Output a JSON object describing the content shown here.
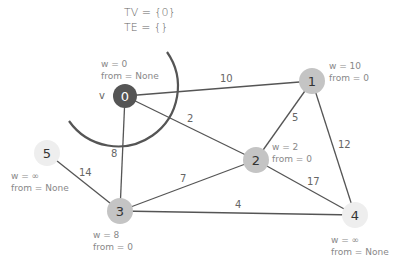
{
  "sets": {
    "tv": "TV = {0}",
    "te": "TE = {}"
  },
  "current_marker": "v",
  "nodes": [
    {
      "id": "0",
      "x": 125,
      "y": 96,
      "fill": "#555555",
      "text_color": "#ffffff",
      "w": "w = 0",
      "from": "from = None"
    },
    {
      "id": "1",
      "x": 312,
      "y": 81,
      "fill": "#c4c4c4",
      "text_color": "#333333",
      "w": "w = 10",
      "from": "from = 0"
    },
    {
      "id": "2",
      "x": 256,
      "y": 160,
      "fill": "#c4c4c4",
      "text_color": "#333333",
      "w": "w = 2",
      "from": "from = 0"
    },
    {
      "id": "3",
      "x": 120,
      "y": 211,
      "fill": "#c4c4c4",
      "text_color": "#333333",
      "w": "w = 8",
      "from": "from = 0"
    },
    {
      "id": "4",
      "x": 355,
      "y": 215,
      "fill": "#eeeeee",
      "text_color": "#333333",
      "w": "w = ∞",
      "from": "from = None"
    },
    {
      "id": "5",
      "x": 47,
      "y": 153,
      "fill": "#eeeeee",
      "text_color": "#333333",
      "w": "w = ∞",
      "from": "from = None"
    }
  ],
  "edges": [
    {
      "from": "0",
      "to": "1",
      "weight": "10"
    },
    {
      "from": "0",
      "to": "2",
      "weight": "2"
    },
    {
      "from": "0",
      "to": "3",
      "weight": "8"
    },
    {
      "from": "1",
      "to": "2",
      "weight": "5"
    },
    {
      "from": "1",
      "to": "4",
      "weight": "12"
    },
    {
      "from": "2",
      "to": "3",
      "weight": "7"
    },
    {
      "from": "2",
      "to": "4",
      "weight": "17"
    },
    {
      "from": "3",
      "to": "4",
      "weight": "4"
    },
    {
      "from": "5",
      "to": "3",
      "weight": "14"
    }
  ]
}
